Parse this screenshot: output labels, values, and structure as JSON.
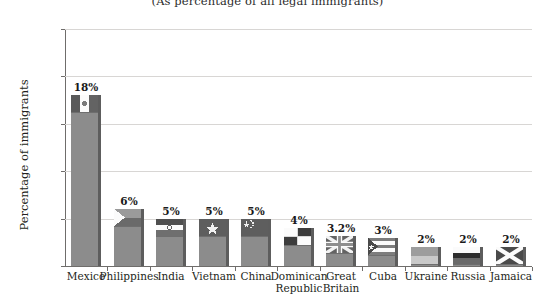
{
  "chart_data": {
    "type": "bar",
    "title": "",
    "subtitle": "(As percentage of all legal immigrants)",
    "xlabel": "",
    "ylabel": "Percentage of immigrants",
    "ylim": [
      0,
      25
    ],
    "ytick_labels": [
      "25%",
      "20%",
      "15%",
      "10%",
      "5%",
      "0"
    ],
    "ytick_values": [
      25,
      20,
      15,
      10,
      5,
      0
    ],
    "grid": true,
    "legend": "none",
    "categories": [
      "Mexico",
      "Philippines",
      "India",
      "Vietnam",
      "China",
      "Dominican\nRepublic",
      "Great\nBritain",
      "Cuba",
      "Ukraine",
      "Russia",
      "Jamaica"
    ],
    "values": [
      18,
      6,
      5,
      5,
      5,
      4,
      3.2,
      3,
      2,
      2,
      2
    ],
    "data_labels": [
      "18%",
      "6%",
      "5%",
      "5%",
      "5%",
      "4%",
      "3.2%",
      "3%",
      "2%",
      "2%",
      "2%"
    ],
    "flags": [
      "mexico-flag",
      "philippines-flag",
      "india-flag",
      "vietnam-flag",
      "china-flag",
      "dominican-republic-flag",
      "great-britain-flag",
      "cuba-flag",
      "ukraine-flag",
      "russia-flag",
      "jamaica-flag"
    ],
    "colors": {
      "bar_fill": "#8c8c8c",
      "bar_shadow": "#5d5d5d",
      "gridline": "#d8d6d4",
      "axis": "#6f6d6b",
      "text": "#231f20"
    }
  }
}
